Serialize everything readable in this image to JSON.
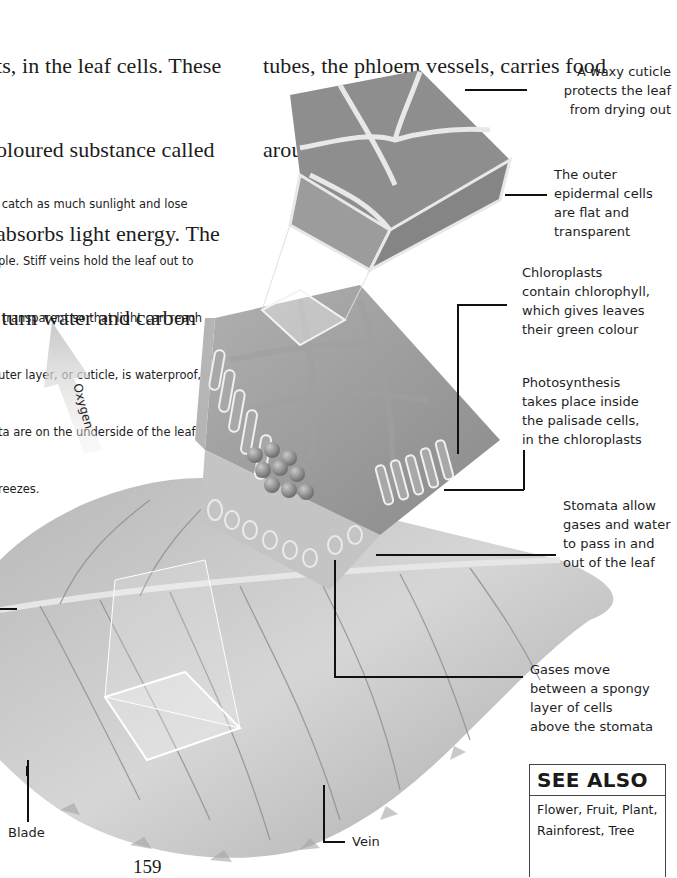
{
  "page": {
    "number": "159"
  },
  "body_text": {
    "left_column": [
      "ts, in the leaf cells. These",
      "oloured substance called",
      "absorbs light energy. The",
      " turn water and carbon"
    ],
    "right_column": [
      "tubes, the phloem vessels, carries food",
      "around the plant."
    ]
  },
  "intro_paragraph": [
    " catch as much sunlight and lose",
    "ple. Stiff veins hold the leaf out to",
    " transparent so that light can reach",
    "uter layer, or cuticle, is waterproof,",
    "ta are on the underside of the leaf,",
    "reezes."
  ],
  "illustration": {
    "arrow_label": "Oxygen",
    "colors": {
      "cell_fill": "#8e8e8e",
      "cell_wall": "#e8e8e8",
      "leaf_light": "#d4d4d4",
      "leaf_dark": "#9a9a9a",
      "chloroplast": "#7b7b7b",
      "leader_line": "#111111"
    }
  },
  "labels": {
    "cuticle": "A waxy cuticle\nprotects the leaf\nfrom drying out",
    "epidermal": "The outer\nepidermal cells\nare flat and\ntransparent",
    "chloroplasts": "Chloroplasts\ncontain chlorophyll,\nwhich gives leaves\ntheir green colour",
    "photosynthesis": "Photosynthesis\ntakes place inside\nthe palisade cells,\nin the chloroplasts",
    "stomata": "Stomata allow\ngases and water\nto pass in and\nout of the leaf",
    "gases": "Gases move\nbetween a spongy\nlayer of cells\nabove the stomata",
    "blade": "Blade",
    "vein": "Vein"
  },
  "see_also": {
    "heading": "SEE ALSO",
    "items": "Flower, Fruit, Plant,\nRainforest, Tree"
  }
}
